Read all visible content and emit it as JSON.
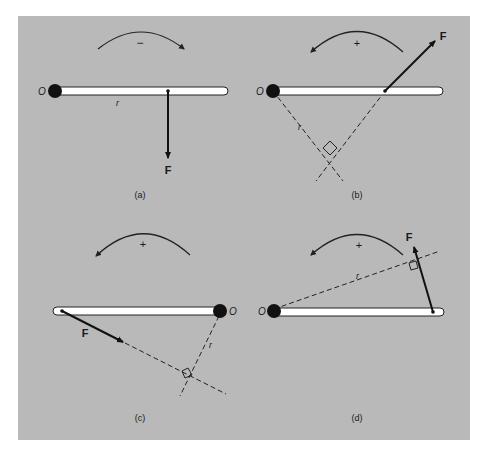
{
  "figure": {
    "background": "#b9b9b9",
    "panels": [
      {
        "id": "a",
        "caption": "(a)",
        "sign": "−",
        "origin_label": "O",
        "radius_label": "r",
        "force_label": "F",
        "rotation": "clockwise"
      },
      {
        "id": "b",
        "caption": "(b)",
        "sign": "+",
        "origin_label": "O",
        "radius_label": "r",
        "force_label": "F",
        "rotation": "counterclockwise"
      },
      {
        "id": "c",
        "caption": "(c)",
        "sign": "+",
        "origin_label": "O",
        "radius_label": "r",
        "force_label": "F",
        "rotation": "counterclockwise"
      },
      {
        "id": "d",
        "caption": "(d)",
        "sign": "+",
        "origin_label": "O",
        "radius_label": "r",
        "force_label": "F",
        "rotation": "counterclockwise"
      }
    ]
  }
}
